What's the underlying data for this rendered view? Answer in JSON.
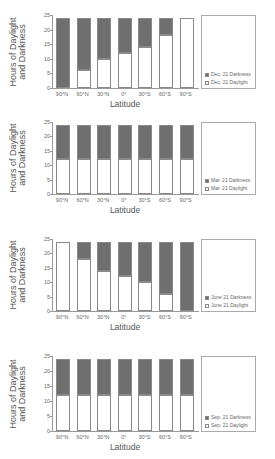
{
  "colors": {
    "darkness": "#6f6f6f",
    "daylight": "#ffffff",
    "border": "#8a8a8a"
  },
  "chart_data": [
    {
      "type": "bar",
      "stacked": true,
      "title": "",
      "xlabel": "Latitude",
      "ylabel": "Hours of Daylight and Darkness",
      "ylim": [
        0,
        25
      ],
      "yticks": [
        0,
        5,
        10,
        15,
        20,
        25
      ],
      "categories": [
        "90°N",
        "60°N",
        "30°N",
        "0°",
        "30°S",
        "60°S",
        "90°S"
      ],
      "series": [
        {
          "name": "Dec. 21 Daylight",
          "values": [
            0,
            6,
            10,
            12,
            14,
            18,
            24
          ]
        },
        {
          "name": "Dec. 21 Darkness",
          "values": [
            24,
            18,
            14,
            12,
            10,
            6,
            0
          ]
        }
      ],
      "legend_position": "right"
    },
    {
      "type": "bar",
      "stacked": true,
      "title": "",
      "xlabel": "Latitude",
      "ylabel": "Hours of Daylight and Darkness",
      "ylim": [
        0,
        25
      ],
      "yticks": [
        0,
        5,
        10,
        15,
        20,
        25
      ],
      "categories": [
        "90°N",
        "60°N",
        "30°N",
        "0°",
        "30°S",
        "60°S",
        "90°S"
      ],
      "series": [
        {
          "name": "Mar. 21 Daylight",
          "values": [
            12,
            12,
            12,
            12,
            12,
            12,
            12
          ]
        },
        {
          "name": "Mar. 21 Darkness",
          "values": [
            12,
            12,
            12,
            12,
            12,
            12,
            12
          ]
        }
      ],
      "legend_position": "right"
    },
    {
      "type": "bar",
      "stacked": true,
      "title": "",
      "xlabel": "Latitude",
      "ylabel": "Hours of Daylight and Darkness",
      "ylim": [
        0,
        25
      ],
      "yticks": [
        0,
        5,
        10,
        15,
        20,
        25
      ],
      "categories": [
        "90°N",
        "60°N",
        "30°N",
        "0°",
        "30°S",
        "60°S",
        "90°S"
      ],
      "series": [
        {
          "name": "June 21 Daylight",
          "values": [
            24,
            18,
            14,
            12,
            10,
            6,
            0
          ]
        },
        {
          "name": "June 21 Darkness",
          "values": [
            0,
            6,
            10,
            12,
            14,
            18,
            24
          ]
        }
      ],
      "legend_position": "right"
    },
    {
      "type": "bar",
      "stacked": true,
      "title": "",
      "xlabel": "Latitude",
      "ylabel": "Hours of Daylight and Darkness",
      "ylim": [
        0,
        25
      ],
      "yticks": [
        0,
        5,
        10,
        15,
        20,
        25
      ],
      "categories": [
        "90°N",
        "60°N",
        "30°N",
        "0°",
        "30°S",
        "60°S",
        "90°S"
      ],
      "series": [
        {
          "name": "Sep. 21 Daylight",
          "values": [
            12,
            12,
            12,
            12,
            12,
            12,
            12
          ]
        },
        {
          "name": "Sep. 21 Darkness",
          "values": [
            12,
            12,
            12,
            12,
            12,
            12,
            12
          ]
        }
      ],
      "legend_position": "right"
    }
  ],
  "charts": [
    {
      "ylabel_line1": "Hours of Daylight",
      "ylabel_line2": "and Darkness",
      "xlabel": "Latitude",
      "legend_darkness": "Dec. 21 Darkness",
      "legend_daylight": "Dec. 21 Daylight"
    },
    {
      "ylabel_line1": "Hours of Daylight",
      "ylabel_line2": "and Darkness",
      "xlabel": "Latitude",
      "legend_darkness": "Mar. 21 Darkness",
      "legend_daylight": "Mar. 21 Daylight"
    },
    {
      "ylabel_line1": "Hours of Daylight",
      "ylabel_line2": "and Darkness",
      "xlabel": "Latitude",
      "legend_darkness": "June 21 Darkness",
      "legend_daylight": "June 21 Daylight"
    },
    {
      "ylabel_line1": "Hours of Daylight",
      "ylabel_line2": "and Darkness",
      "xlabel": "Latitude",
      "legend_darkness": "Sep. 21 Darkness",
      "legend_daylight": "Sep. 21 Daylight"
    }
  ]
}
